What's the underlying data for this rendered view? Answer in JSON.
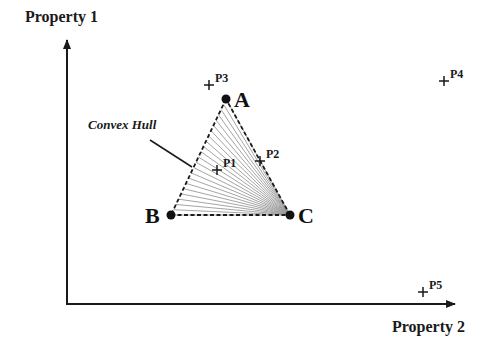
{
  "axes": {
    "y_label": "Property 1",
    "x_label": "Property 2"
  },
  "hull": {
    "label": "Convex Hull",
    "vertices": [
      {
        "name": "A",
        "x": 226,
        "y": 99
      },
      {
        "name": "B",
        "x": 171,
        "y": 215
      },
      {
        "name": "C",
        "x": 290,
        "y": 215
      }
    ],
    "fan_origin": "C",
    "fan_line_count": 22
  },
  "points": [
    {
      "name": "P1",
      "x": 217,
      "y": 170
    },
    {
      "name": "P2",
      "x": 260,
      "y": 161
    },
    {
      "name": "P3",
      "x": 209,
      "y": 85
    },
    {
      "name": "P4",
      "x": 444,
      "y": 81
    },
    {
      "name": "P5",
      "x": 423,
      "y": 292
    }
  ],
  "colors": {
    "ink": "#1a1a1a",
    "fan": "#9a9a9a",
    "background": "#ffffff"
  }
}
